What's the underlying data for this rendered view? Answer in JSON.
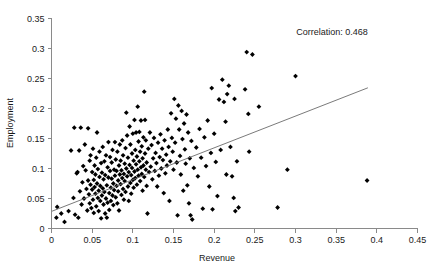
{
  "chart_data": {
    "type": "scatter",
    "title": "",
    "xlabel": "Revenue",
    "ylabel": "Employment",
    "xlim": [
      0,
      0.45
    ],
    "ylim": [
      0,
      0.35
    ],
    "xticks": [
      0,
      0.05,
      0.1,
      0.15,
      0.2,
      0.25,
      0.3,
      0.35,
      0.4,
      0.45
    ],
    "xtick_labels": [
      "0",
      "0.05",
      "0.1",
      "0.15",
      "0.2",
      "0.25",
      "0.3",
      "0.35",
      "0.4",
      "0.45"
    ],
    "yticks": [
      0,
      0.05,
      0.1,
      0.15,
      0.2,
      0.25,
      0.3,
      0.35
    ],
    "ytick_labels": [
      "0",
      "0.05",
      "0.1",
      "0.15",
      "0.2",
      "0.25",
      "0.3",
      "0.35"
    ],
    "grid": false,
    "legend": null,
    "marker": "diamond",
    "marker_color": "#000000",
    "annotations": [
      {
        "text": "Correlation: 0.468",
        "x": 0.345,
        "y": 0.322
      }
    ],
    "trendline": {
      "type": "linear",
      "color": "#6b6b6b",
      "x_start": 0.0,
      "y_start": 0.0285,
      "x_end": 0.389,
      "y_end": 0.2345
    },
    "series": [
      {
        "name": "Firms",
        "marker": "diamond",
        "color": "#000000",
        "points": [
          [
            0.006,
            0.018
          ],
          [
            0.007,
            0.036
          ],
          [
            0.012,
            0.025
          ],
          [
            0.016,
            0.011
          ],
          [
            0.021,
            0.029
          ],
          [
            0.024,
            0.13
          ],
          [
            0.027,
            0.051
          ],
          [
            0.028,
            0.168
          ],
          [
            0.029,
            0.023
          ],
          [
            0.031,
            0.092
          ],
          [
            0.032,
            0.094
          ],
          [
            0.033,
            0.018
          ],
          [
            0.034,
            0.13
          ],
          [
            0.035,
            0.062
          ],
          [
            0.036,
            0.168
          ],
          [
            0.037,
            0.04
          ],
          [
            0.038,
            0.077
          ],
          [
            0.039,
            0.104
          ],
          [
            0.04,
            0.05
          ],
          [
            0.041,
            0.14
          ],
          [
            0.042,
            0.097
          ],
          [
            0.043,
            0.066
          ],
          [
            0.044,
            0.03
          ],
          [
            0.045,
            0.08
          ],
          [
            0.045,
            0.167
          ],
          [
            0.046,
            0.057
          ],
          [
            0.047,
            0.113
          ],
          [
            0.047,
            0.042
          ],
          [
            0.048,
            0.073
          ],
          [
            0.048,
            0.122
          ],
          [
            0.049,
            0.034
          ],
          [
            0.05,
            0.065
          ],
          [
            0.05,
            0.094
          ],
          [
            0.051,
            0.048
          ],
          [
            0.051,
            0.133
          ],
          [
            0.052,
            0.081
          ],
          [
            0.052,
            0.026
          ],
          [
            0.053,
            0.069
          ],
          [
            0.053,
            0.105
          ],
          [
            0.054,
            0.058
          ],
          [
            0.054,
            0.09
          ],
          [
            0.055,
            0.037
          ],
          [
            0.055,
            0.118
          ],
          [
            0.056,
            0.075
          ],
          [
            0.056,
            0.16
          ],
          [
            0.057,
            0.051
          ],
          [
            0.057,
            0.099
          ],
          [
            0.058,
            0.063
          ],
          [
            0.058,
            0.029
          ],
          [
            0.059,
            0.086
          ],
          [
            0.059,
            0.128
          ],
          [
            0.06,
            0.046
          ],
          [
            0.06,
            0.071
          ],
          [
            0.061,
            0.109
          ],
          [
            0.061,
            0.017
          ],
          [
            0.062,
            0.055
          ],
          [
            0.062,
            0.093
          ],
          [
            0.063,
            0.067
          ],
          [
            0.063,
            0.136
          ],
          [
            0.064,
            0.04
          ],
          [
            0.064,
            0.082
          ],
          [
            0.065,
            0.112
          ],
          [
            0.065,
            0.061
          ],
          [
            0.066,
            0.025
          ],
          [
            0.066,
            0.089
          ],
          [
            0.067,
            0.05
          ],
          [
            0.067,
            0.122
          ],
          [
            0.068,
            0.072
          ],
          [
            0.068,
            0.018
          ],
          [
            0.069,
            0.102
          ],
          [
            0.069,
            0.043
          ],
          [
            0.07,
            0.085
          ],
          [
            0.07,
            0.144
          ],
          [
            0.071,
            0.059
          ],
          [
            0.071,
            0.031
          ],
          [
            0.072,
            0.096
          ],
          [
            0.072,
            0.119
          ],
          [
            0.073,
            0.068
          ],
          [
            0.073,
            0.046
          ],
          [
            0.074,
            0.11
          ],
          [
            0.074,
            0.083
          ],
          [
            0.075,
            0.055
          ],
          [
            0.075,
            0.131
          ],
          [
            0.076,
            0.075
          ],
          [
            0.076,
            0.039
          ],
          [
            0.077,
            0.098
          ],
          [
            0.077,
            0.064
          ],
          [
            0.078,
            0.144
          ],
          [
            0.078,
            0.088
          ],
          [
            0.079,
            0.052
          ],
          [
            0.079,
            0.115
          ],
          [
            0.08,
            0.071
          ],
          [
            0.08,
            0.096
          ],
          [
            0.081,
            0.042
          ],
          [
            0.081,
            0.128
          ],
          [
            0.082,
            0.08
          ],
          [
            0.082,
            0.062
          ],
          [
            0.083,
            0.105
          ],
          [
            0.083,
            0.03
          ],
          [
            0.084,
            0.09
          ],
          [
            0.084,
            0.14
          ],
          [
            0.085,
            0.074
          ],
          [
            0.085,
            0.113
          ],
          [
            0.086,
            0.056
          ],
          [
            0.086,
            0.097
          ],
          [
            0.087,
            0.084
          ],
          [
            0.087,
            0.147
          ],
          [
            0.088,
            0.066
          ],
          [
            0.088,
            0.122
          ],
          [
            0.089,
            0.091
          ],
          [
            0.089,
            0.048
          ],
          [
            0.09,
            0.108
          ],
          [
            0.09,
            0.079
          ],
          [
            0.091,
            0.134
          ],
          [
            0.091,
            0.061
          ],
          [
            0.092,
            0.1
          ],
          [
            0.092,
            0.193
          ],
          [
            0.093,
            0.087
          ],
          [
            0.093,
            0.155
          ],
          [
            0.094,
            0.07
          ],
          [
            0.094,
            0.118
          ],
          [
            0.095,
            0.094
          ],
          [
            0.095,
            0.046
          ],
          [
            0.096,
            0.17
          ],
          [
            0.096,
            0.106
          ],
          [
            0.097,
            0.076
          ],
          [
            0.097,
            0.14
          ],
          [
            0.098,
            0.089
          ],
          [
            0.098,
            0.058
          ],
          [
            0.099,
            0.125
          ],
          [
            0.099,
            0.101
          ],
          [
            0.1,
            0.081
          ],
          [
            0.1,
            0.158
          ],
          [
            0.101,
            0.068
          ],
          [
            0.101,
            0.113
          ],
          [
            0.102,
            0.095
          ],
          [
            0.102,
            0.181
          ],
          [
            0.103,
            0.131
          ],
          [
            0.103,
            0.084
          ],
          [
            0.104,
            0.107
          ],
          [
            0.104,
            0.16
          ],
          [
            0.105,
            0.073
          ],
          [
            0.105,
            0.12
          ],
          [
            0.106,
            0.098
          ],
          [
            0.106,
            0.203
          ],
          [
            0.107,
            0.145
          ],
          [
            0.107,
            0.088
          ],
          [
            0.108,
            0.112
          ],
          [
            0.108,
            0.161
          ],
          [
            0.109,
            0.079
          ],
          [
            0.109,
            0.128
          ],
          [
            0.11,
            0.102
          ],
          [
            0.11,
            0.18
          ],
          [
            0.111,
            0.091
          ],
          [
            0.111,
            0.137
          ],
          [
            0.112,
            0.117
          ],
          [
            0.112,
            0.063
          ],
          [
            0.113,
            0.152
          ],
          [
            0.113,
            0.105
          ],
          [
            0.114,
            0.228
          ],
          [
            0.114,
            0.086
          ],
          [
            0.115,
            0.125
          ],
          [
            0.115,
            0.181
          ],
          [
            0.116,
            0.098
          ],
          [
            0.116,
            0.147
          ],
          [
            0.117,
            0.11
          ],
          [
            0.117,
            0.071
          ],
          [
            0.118,
            0.025
          ],
          [
            0.119,
            0.133
          ],
          [
            0.12,
            0.094
          ],
          [
            0.121,
            0.16
          ],
          [
            0.122,
            0.103
          ],
          [
            0.123,
            0.139
          ],
          [
            0.124,
            0.082
          ],
          [
            0.125,
            0.117
          ],
          [
            0.126,
            0.151
          ],
          [
            0.127,
            0.096
          ],
          [
            0.128,
            0.126
          ],
          [
            0.129,
            0.109
          ],
          [
            0.13,
            0.07
          ],
          [
            0.131,
            0.143
          ],
          [
            0.132,
            0.088
          ],
          [
            0.133,
            0.119
          ],
          [
            0.134,
            0.157
          ],
          [
            0.135,
            0.1
          ],
          [
            0.136,
            0.133
          ],
          [
            0.137,
            0.114
          ],
          [
            0.138,
            0.059
          ],
          [
            0.139,
            0.147
          ],
          [
            0.14,
            0.092
          ],
          [
            0.141,
            0.123
          ],
          [
            0.142,
            0.105
          ],
          [
            0.143,
            0.165
          ],
          [
            0.144,
            0.136
          ],
          [
            0.145,
            0.046
          ],
          [
            0.146,
            0.112
          ],
          [
            0.147,
            0.192
          ],
          [
            0.148,
            0.151
          ],
          [
            0.149,
            0.128
          ],
          [
            0.15,
            0.098
          ],
          [
            0.151,
            0.216
          ],
          [
            0.152,
            0.143
          ],
          [
            0.153,
            0.183
          ],
          [
            0.154,
            0.11
          ],
          [
            0.155,
            0.022
          ],
          [
            0.156,
            0.205
          ],
          [
            0.157,
            0.165
          ],
          [
            0.158,
            0.121
          ],
          [
            0.159,
            0.09
          ],
          [
            0.16,
            0.196
          ],
          [
            0.161,
            0.149
          ],
          [
            0.162,
            0.063
          ],
          [
            0.163,
            0.175
          ],
          [
            0.164,
            0.132
          ],
          [
            0.165,
            0.108
          ],
          [
            0.166,
            0.19
          ],
          [
            0.167,
            0.072
          ],
          [
            0.168,
            0.16
          ],
          [
            0.169,
            0.042
          ],
          [
            0.17,
            0.117
          ],
          [
            0.171,
            0.022
          ],
          [
            0.172,
            0.146
          ],
          [
            0.173,
            0.015
          ],
          [
            0.175,
            0.101
          ],
          [
            0.178,
            0.135
          ],
          [
            0.18,
            0.087
          ],
          [
            0.182,
            0.166
          ],
          [
            0.184,
            0.118
          ],
          [
            0.186,
            0.033
          ],
          [
            0.188,
            0.152
          ],
          [
            0.19,
            0.104
          ],
          [
            0.192,
            0.18
          ],
          [
            0.194,
            0.07
          ],
          [
            0.196,
            0.126
          ],
          [
            0.197,
            0.234
          ],
          [
            0.198,
            0.032
          ],
          [
            0.2,
            0.158
          ],
          [
            0.202,
            0.111
          ],
          [
            0.204,
            0.054
          ],
          [
            0.206,
            0.215
          ],
          [
            0.208,
            0.131
          ],
          [
            0.21,
            0.248
          ],
          [
            0.212,
            0.211
          ],
          [
            0.214,
            0.178
          ],
          [
            0.215,
            0.09
          ],
          [
            0.216,
            0.224
          ],
          [
            0.218,
            0.238
          ],
          [
            0.22,
            0.136
          ],
          [
            0.222,
            0.087
          ],
          [
            0.224,
            0.051
          ],
          [
            0.225,
            0.216
          ],
          [
            0.226,
            0.029
          ],
          [
            0.228,
            0.112
          ],
          [
            0.23,
            0.035
          ],
          [
            0.238,
            0.232
          ],
          [
            0.24,
            0.294
          ],
          [
            0.242,
            0.191
          ],
          [
            0.243,
            0.128
          ],
          [
            0.247,
            0.29
          ],
          [
            0.255,
            0.203
          ],
          [
            0.278,
            0.035
          ],
          [
            0.29,
            0.098
          ],
          [
            0.3,
            0.254
          ],
          [
            0.388,
            0.08
          ]
        ]
      }
    ]
  },
  "axes": {
    "x_title": "Revenue",
    "y_title": "Employment"
  }
}
